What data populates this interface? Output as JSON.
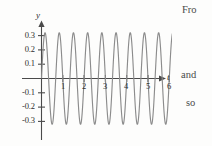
{
  "figure": {
    "name": "sinusoid-graph",
    "axis_labels": {
      "y": "y",
      "t": "t"
    },
    "y_ticks": [
      "0.3",
      "0.2",
      "0.1",
      "-0.1",
      "-0.2",
      "-0.3"
    ],
    "x_ticks": [
      "1",
      "2",
      "3",
      "4",
      "5",
      "6"
    ],
    "colors": {
      "curve": "#8c8c8c",
      "axis": "#4a4a4a",
      "text": "#2f2f2f",
      "background": "#fdfdfc"
    }
  },
  "body_text": {
    "fragment_top": "Fro",
    "fragment_mid": "and",
    "fragment_bottom": "so"
  },
  "chart_data": {
    "type": "line",
    "title": "",
    "xlabel": "t",
    "ylabel": "y",
    "xlim": [
      -0.12,
      6.45
    ],
    "ylim": [
      -0.355,
      0.355
    ],
    "grid": false,
    "legend": null,
    "amplitude": 0.32,
    "cycles_per_unit": 1.5,
    "period": 0.667,
    "phase": 0,
    "equation": "y = 0.32 sin(3πt)",
    "xticks": [
      1,
      2,
      3,
      4,
      5,
      6
    ],
    "yticks": [
      -0.3,
      -0.2,
      -0.1,
      0.1,
      0.2,
      0.3
    ],
    "x": [
      0.0,
      0.05,
      0.1,
      0.15,
      0.2,
      0.25,
      0.3,
      0.35,
      0.4,
      0.45,
      0.5,
      0.55,
      0.6,
      0.65,
      0.7,
      0.75,
      0.8,
      0.85,
      0.9,
      0.95,
      1.0,
      1.05,
      1.1,
      1.15,
      1.2,
      1.25,
      1.3,
      1.35,
      1.4,
      1.45,
      1.5,
      1.55,
      1.6,
      1.65,
      1.7,
      1.75,
      1.8,
      1.85,
      1.9,
      1.95,
      2.0,
      2.05,
      2.1,
      2.15,
      2.2,
      2.25,
      2.3,
      2.35,
      2.4,
      2.45,
      2.5,
      2.55,
      2.6,
      2.65,
      2.7,
      2.75,
      2.8,
      2.85,
      2.9,
      2.95,
      3.0,
      3.05,
      3.1,
      3.15,
      3.2,
      3.25,
      3.3,
      3.35,
      3.4,
      3.45,
      3.5,
      3.55,
      3.6,
      3.65,
      3.7,
      3.75,
      3.8,
      3.85,
      3.9,
      3.95,
      4.0,
      4.05,
      4.1,
      4.15,
      4.2,
      4.25,
      4.3,
      4.35,
      4.4,
      4.45,
      4.5,
      4.55,
      4.6,
      4.65,
      4.7,
      4.75,
      4.8,
      4.85,
      4.9,
      4.95,
      5.0,
      5.05,
      5.1,
      5.15,
      5.2,
      5.25,
      5.3,
      5.35,
      5.4,
      5.45,
      5.5,
      5.55,
      5.6,
      5.65,
      5.7,
      5.75,
      5.8,
      5.85,
      5.9,
      5.95,
      6.0,
      6.05,
      6.1,
      6.15,
      6.2,
      6.25,
      6.3
    ],
    "y_desc": "y(t) = 0.32 * sin(3*pi*t), sampled at dx = 0.05 over t in [0, 6.3]"
  }
}
